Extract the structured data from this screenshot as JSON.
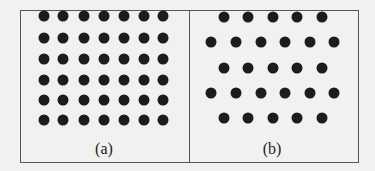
{
  "panels": [
    {
      "id": "a",
      "caption": "(a)",
      "caption_pos": [
        104,
        140
      ],
      "arrangement": "square lattice",
      "rows": 6,
      "cols": 7,
      "xs": [
        44,
        63,
        84,
        104,
        124,
        144,
        163
      ],
      "ys": [
        16,
        38,
        59,
        80,
        100,
        120
      ]
    },
    {
      "id": "b",
      "caption": "(b)",
      "caption_pos": [
        272,
        140
      ],
      "arrangement": "hexagonal lattice",
      "rows": [
        {
          "y": 17,
          "xs": [
            224,
            248,
            273,
            297,
            322
          ]
        },
        {
          "y": 42,
          "xs": [
            211,
            236,
            261,
            285,
            310,
            334
          ]
        },
        {
          "y": 68,
          "xs": [
            224,
            248,
            273,
            297,
            322
          ]
        },
        {
          "y": 93,
          "xs": [
            211,
            236,
            261,
            285,
            310,
            334
          ]
        },
        {
          "y": 118,
          "xs": [
            224,
            248,
            273,
            297,
            322
          ]
        }
      ]
    }
  ],
  "colors": {
    "dot": "#1c1c1c",
    "border": "#555555",
    "background": "#f1f1f0"
  }
}
